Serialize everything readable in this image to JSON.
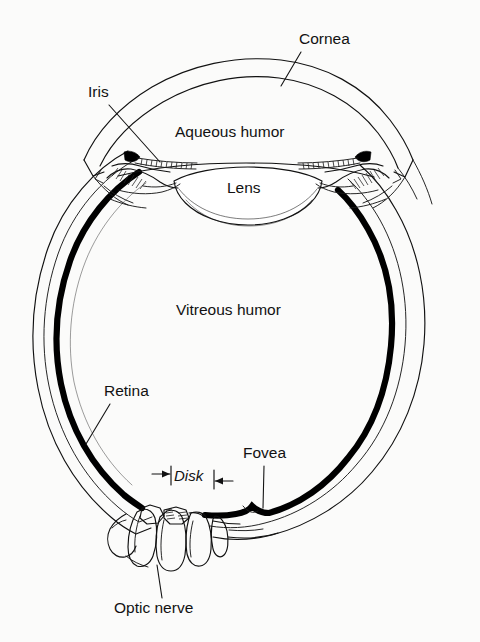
{
  "figure": {
    "kind": "anatomical-cross-section",
    "background_color": "#fbfbfa",
    "ink_color": "#111111",
    "width": 480,
    "height": 642
  },
  "labels": {
    "cornea": "Cornea",
    "iris": "Iris",
    "aqueous_humor": "Aqueous humor",
    "lens": "Lens",
    "vitreous_humor": "Vitreous humor",
    "retina": "Retina",
    "fovea": "Fovea",
    "disk": "Disk",
    "optic_nerve": "Optic nerve"
  },
  "label_positions": {
    "cornea": {
      "x": 299,
      "y": 44
    },
    "iris": {
      "x": 88,
      "y": 97
    },
    "aqueous_humor": {
      "x": 175,
      "y": 137
    },
    "lens": {
      "x": 227,
      "y": 193
    },
    "vitreous_humor": {
      "x": 176,
      "y": 315
    },
    "retina": {
      "x": 104,
      "y": 396
    },
    "fovea": {
      "x": 243,
      "y": 458
    },
    "disk": {
      "x": 174,
      "y": 481
    },
    "optic_nerve": {
      "x": 114,
      "y": 613
    }
  },
  "parts": [
    {
      "name": "cornea",
      "description": "transparent dome at front (top) of eye, drawn as double arc"
    },
    {
      "name": "sclera",
      "description": "thin outer wall line of the globe"
    },
    {
      "name": "retina",
      "description": "thick black band lining the inner wall of the globe"
    },
    {
      "name": "iris",
      "description": "dark wedge with hatched ciliary body on each side"
    },
    {
      "name": "lens",
      "description": "lentil shaped body below the aqueous chamber"
    },
    {
      "name": "aqueous-humor",
      "description": "chamber between cornea and lens"
    },
    {
      "name": "vitreous-humor",
      "description": "large interior chamber of the globe"
    },
    {
      "name": "fovea",
      "description": "small notch in retina band right of the disk"
    },
    {
      "name": "optic-disk",
      "description": "region where optic nerve meets retina, marked by Disk span"
    },
    {
      "name": "optic-nerve",
      "description": "bundle of tubes leaving the bottom of the globe"
    }
  ],
  "disk_markers": {
    "left_arrow": "arrow pointing right into left tick",
    "right_arrow": "arrow pointing left into right tick"
  }
}
